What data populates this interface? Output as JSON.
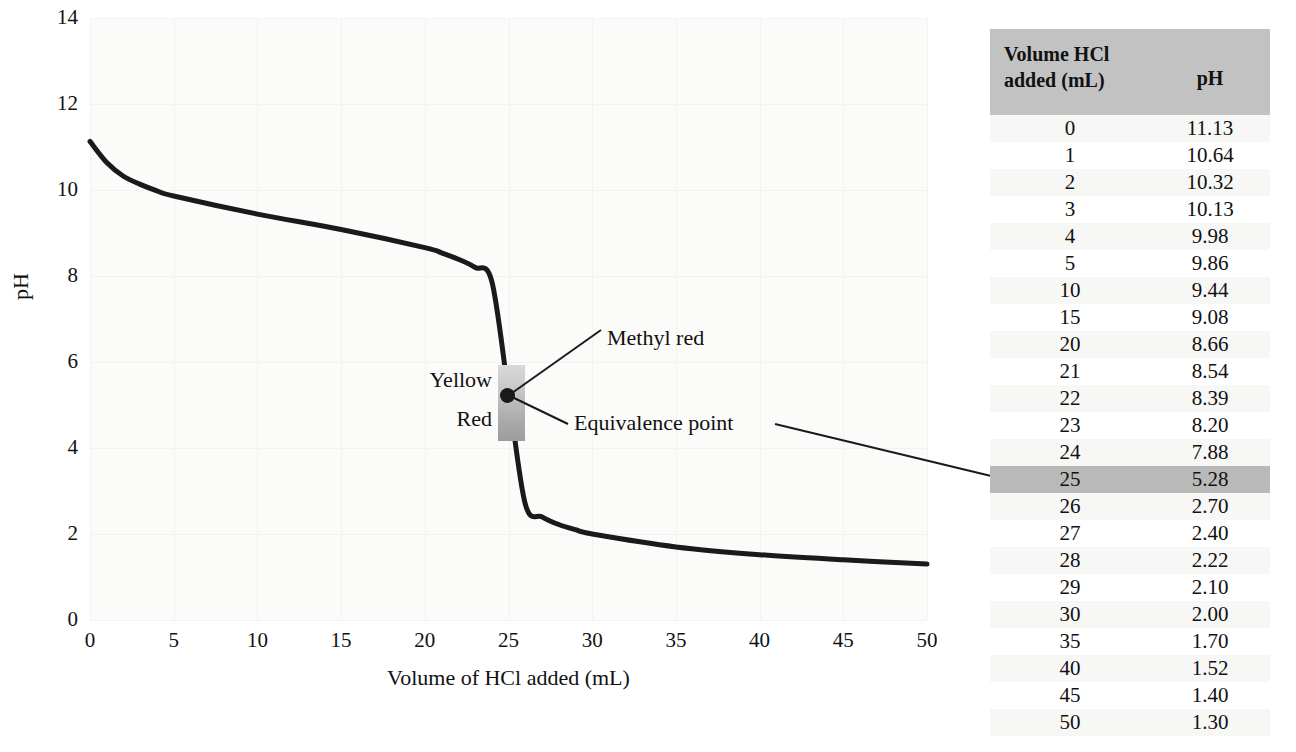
{
  "chart_data": {
    "type": "line",
    "title": "",
    "xlabel": "Volume of HCl added (mL)",
    "ylabel": "pH",
    "xlim": [
      0,
      50
    ],
    "ylim": [
      0,
      14
    ],
    "xticks": [
      0,
      5,
      10,
      15,
      20,
      25,
      30,
      35,
      40,
      45,
      50
    ],
    "yticks": [
      0,
      2,
      4,
      6,
      8,
      10,
      12,
      14
    ],
    "grid": true,
    "x": [
      0,
      1,
      2,
      3,
      4,
      5,
      10,
      15,
      20,
      21,
      22,
      23,
      24,
      25,
      26,
      27,
      28,
      29,
      30,
      35,
      40,
      45,
      50
    ],
    "y": [
      11.13,
      10.64,
      10.32,
      10.13,
      9.98,
      9.86,
      9.44,
      9.08,
      8.66,
      8.54,
      8.39,
      8.2,
      7.88,
      5.28,
      2.7,
      2.4,
      2.22,
      2.1,
      2.0,
      1.7,
      1.52,
      1.4,
      1.3
    ],
    "series": [
      {
        "name": "Titration of weak base with HCl",
        "values": [
          11.13,
          10.64,
          10.32,
          10.13,
          9.98,
          9.86,
          9.44,
          9.08,
          8.66,
          8.54,
          8.39,
          8.2,
          7.88,
          5.28,
          2.7,
          2.4,
          2.22,
          2.1,
          2.0,
          1.7,
          1.52,
          1.4,
          1.3
        ]
      }
    ],
    "annotations": [
      {
        "name": "methyl-red",
        "label": "Methyl red",
        "x": 25,
        "y": 5.28
      },
      {
        "name": "equivalence-point",
        "label": "Equivalence point",
        "x": 25,
        "y": 5.28
      },
      {
        "name": "indicator-yellow",
        "label": "Yellow",
        "y_range": [
          5.4,
          6.3
        ]
      },
      {
        "name": "indicator-red",
        "label": "Red",
        "y_range": [
          4.5,
          5.4
        ]
      }
    ],
    "indicator_band": {
      "name": "methyl red transition range",
      "x": 25,
      "y_low": 4.5,
      "y_high": 6.3,
      "upper_color_label": "Yellow",
      "lower_color_label": "Red"
    },
    "equivalence_point": {
      "volume_mL": 25,
      "pH": 5.28
    }
  },
  "axes": {
    "y_title": "pH",
    "x_title": "Volume of HCl added (mL)",
    "y_ticks": [
      "14",
      "12",
      "10",
      "8",
      "6",
      "4",
      "2",
      "0"
    ],
    "x_ticks": [
      "0",
      "5",
      "10",
      "15",
      "20",
      "25",
      "30",
      "35",
      "40",
      "45",
      "50"
    ]
  },
  "callouts": {
    "methyl_red": "Methyl red",
    "equivalence_point": "Equivalence point",
    "yellow": "Yellow",
    "red": "Red"
  },
  "table": {
    "headers": {
      "volume": "Volume HCl added (mL)",
      "volume_line1": "Volume HCl",
      "volume_line2": "added (mL)",
      "ph": "pH"
    },
    "highlight_volume": "25",
    "rows": [
      {
        "volume": "0",
        "ph": "11.13"
      },
      {
        "volume": "1",
        "ph": "10.64"
      },
      {
        "volume": "2",
        "ph": "10.32"
      },
      {
        "volume": "3",
        "ph": "10.13"
      },
      {
        "volume": "4",
        "ph": "9.98"
      },
      {
        "volume": "5",
        "ph": "9.86"
      },
      {
        "volume": "10",
        "ph": "9.44"
      },
      {
        "volume": "15",
        "ph": "9.08"
      },
      {
        "volume": "20",
        "ph": "8.66"
      },
      {
        "volume": "21",
        "ph": "8.54"
      },
      {
        "volume": "22",
        "ph": "8.39"
      },
      {
        "volume": "23",
        "ph": "8.20"
      },
      {
        "volume": "24",
        "ph": "7.88"
      },
      {
        "volume": "25",
        "ph": "5.28"
      },
      {
        "volume": "26",
        "ph": "2.70"
      },
      {
        "volume": "27",
        "ph": "2.40"
      },
      {
        "volume": "28",
        "ph": "2.22"
      },
      {
        "volume": "29",
        "ph": "2.10"
      },
      {
        "volume": "30",
        "ph": "2.00"
      },
      {
        "volume": "35",
        "ph": "1.70"
      },
      {
        "volume": "40",
        "ph": "1.52"
      },
      {
        "volume": "45",
        "ph": "1.40"
      },
      {
        "volume": "50",
        "ph": "1.30"
      }
    ]
  },
  "colors": {
    "curve": "#1a1a1a",
    "plot_background": "#fbfbfa",
    "gridline": "#f2f2f0",
    "table_header": "#c2c2c2",
    "table_highlight": "#b9b9b9",
    "band_top": "#d9d9d9",
    "band_bottom": "#9d9d9d"
  }
}
